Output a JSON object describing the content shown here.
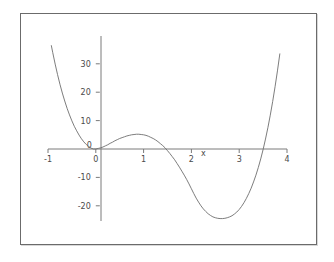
{
  "figure": {
    "background_color": "#ffffff",
    "frame_color": "#6b6b6b",
    "curve_color": "#6e6e6e",
    "axis_color": "#7a7a7a",
    "tick_label_color": "#4a4a4a"
  },
  "chart_data": {
    "type": "line",
    "title": "",
    "subtitle": "",
    "xlabel": "x",
    "ylabel": "",
    "xlim": [
      -1,
      4
    ],
    "ylim": [
      -26,
      37
    ],
    "grid": false,
    "legend": null,
    "axes_style": "crossed-axes-at-origin",
    "x_ticks": [
      -1,
      0,
      1,
      2,
      3,
      4
    ],
    "x_tick_labels": [
      "-1",
      "0",
      "1",
      "2",
      "3",
      "4"
    ],
    "y_ticks": [
      -20,
      -10,
      0,
      10,
      20,
      30
    ],
    "y_tick_labels": [
      "-20",
      "-10",
      "0",
      "10",
      "20",
      "30"
    ],
    "annotations": [
      {
        "text": "x",
        "x": 2.25,
        "y": -2.4,
        "name": "x-axis-label"
      }
    ],
    "series": [
      {
        "name": "curve",
        "expression": "x^4 - 6x^3 + 7x^2 + 3x",
        "x": [
          -0.93,
          -0.9,
          -0.85,
          -0.8,
          -0.75,
          -0.7,
          -0.65,
          -0.6,
          -0.55,
          -0.5,
          -0.45,
          -0.4,
          -0.35,
          -0.3,
          -0.25,
          -0.2,
          -0.15,
          -0.1,
          -0.05,
          0.0,
          0.05,
          0.1,
          0.15,
          0.2,
          0.25,
          0.3,
          0.35,
          0.4,
          0.45,
          0.5,
          0.55,
          0.6,
          0.65,
          0.7,
          0.75,
          0.8,
          0.85,
          0.9,
          0.95,
          1.0,
          1.05,
          1.1,
          1.15,
          1.2,
          1.25,
          1.3,
          1.35,
          1.4,
          1.45,
          1.5,
          1.55,
          1.6,
          1.65,
          1.7,
          1.75,
          1.8,
          1.85,
          1.9,
          1.95,
          2.0,
          2.05,
          2.1,
          2.15,
          2.2,
          2.25,
          2.3,
          2.35,
          2.4,
          2.45,
          2.5,
          2.55,
          2.6,
          2.65,
          2.7,
          2.75,
          2.8,
          2.85,
          2.9,
          2.95,
          3.0,
          3.05,
          3.1,
          3.15,
          3.2,
          3.25,
          3.3,
          3.35,
          3.4,
          3.45,
          3.5,
          3.55,
          3.6,
          3.65,
          3.7,
          3.75,
          3.8,
          3.85,
          3.9,
          3.95,
          4.0
        ],
        "y": [
          36.4,
          33.9,
          29.9,
          26.2,
          22.8,
          19.7,
          16.9,
          14.3,
          12.0,
          9.9,
          8.0,
          6.4,
          4.9,
          3.6,
          2.5,
          1.6,
          0.9,
          0.3,
          0.0,
          0.0,
          0.2,
          0.4,
          0.7,
          1.1,
          1.5,
          2.0,
          2.4,
          2.9,
          3.3,
          3.7,
          4.0,
          4.3,
          4.6,
          4.8,
          5.0,
          5.1,
          5.2,
          5.2,
          5.1,
          5.0,
          4.8,
          4.5,
          4.1,
          3.7,
          3.2,
          2.6,
          1.9,
          1.2,
          0.4,
          -0.6,
          -1.6,
          -2.7,
          -3.8,
          -5.1,
          -6.4,
          -7.8,
          -9.2,
          -10.7,
          -12.3,
          -14.0,
          -15.7,
          -17.3,
          -18.7,
          -20.0,
          -21.1,
          -22.0,
          -22.8,
          -23.4,
          -23.9,
          -24.2,
          -24.4,
          -24.5,
          -24.5,
          -24.4,
          -24.2,
          -23.9,
          -23.5,
          -22.9,
          -22.2,
          -21.3,
          -20.2,
          -18.9,
          -17.4,
          -15.7,
          -13.8,
          -11.6,
          -9.2,
          -6.5,
          -3.5,
          -0.2,
          3.5,
          7.5,
          11.9,
          16.7,
          21.9,
          27.5,
          33.5,
          40.0,
          46.9,
          54.3
        ],
        "features": {
          "local_max": {
            "x": 1.0,
            "y": 5.2
          },
          "local_min": {
            "x": 3.0,
            "y": -24.2
          },
          "roots_visible": [
            0.0,
            1.73,
            3.62
          ]
        }
      }
    ]
  }
}
